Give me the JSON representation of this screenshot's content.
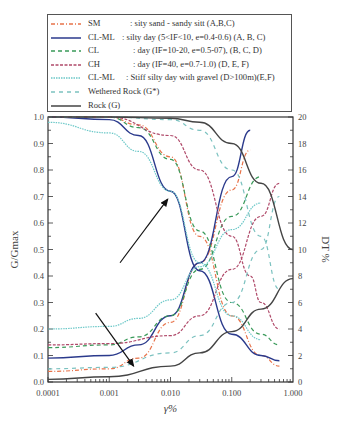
{
  "legend": {
    "items": [
      {
        "code": "SM",
        "desc": ": sity sand - sandy sitt (A,B,C)",
        "color": "#e8734a",
        "dash": "4,2,1,2",
        "desc_x": 82
      },
      {
        "code": "CL-ML",
        "desc": ": silty day (5<IF<10, e=0.4-0.6) (A, B, C)",
        "color": "#2b3a8c",
        "dash": "",
        "desc_x": 74
      },
      {
        "code": "CL",
        "desc": ": day (IF=10-20, e=0.5-07), (B, C, D)",
        "color": "#3a9a5a",
        "dash": "4,3",
        "desc_x": 85
      },
      {
        "code": "CH",
        "desc": ": day (IF=40, e=0.7-1.0) (D, E, F)",
        "color": "#b04a6a",
        "dash": "3,1.5",
        "desc_x": 85
      },
      {
        "code": "CL-ML",
        "desc": ": Stiff silty day with gravel (D>100m)(E,F)",
        "color": "#6cc8c8",
        "dash": "1.5,1",
        "desc_x": 78
      },
      {
        "code": "Wethered Rock (G*)",
        "desc": "",
        "color": "#7cc2c0",
        "dash": "4,4",
        "desc_x": 0
      },
      {
        "code": "Rock (G)",
        "desc": "",
        "color": "#444444",
        "dash": "",
        "desc_x": 0
      }
    ]
  },
  "axes": {
    "x_label": "γ%",
    "left_label": "G/Gmax",
    "right_label": "DT %",
    "x_ticks": [
      "0.0001",
      "0.001",
      "0.010",
      "0.100",
      "1.000"
    ],
    "left_ticks": [
      "0.0",
      "0.1",
      "0.2",
      "0.3",
      "0.4",
      "0.5",
      "0.6",
      "0.7",
      "0.8",
      "0.9",
      "1.0"
    ],
    "right_ticks": [
      "0",
      "2",
      "4",
      "6",
      "8",
      "10",
      "12",
      "14",
      "16",
      "18",
      "20"
    ]
  },
  "chart_data": {
    "type": "line",
    "title": "",
    "xlabel": "γ%",
    "ylabel": "G/Gmax",
    "y2label": "DT %",
    "xscale": "log",
    "xlim": [
      0.0001,
      1.0
    ],
    "ylim": [
      0.0,
      1.0
    ],
    "y2lim": [
      0,
      20
    ],
    "grid": false,
    "legend_position": "top (above plot)",
    "annotations": [
      {
        "type": "arrow",
        "from": [
          0.0015,
          0.45
        ],
        "to": [
          0.009,
          0.69
        ],
        "meaning": "G/Gmax curves"
      },
      {
        "type": "arrow",
        "from": [
          0.0006,
          0.26
        ],
        "to": [
          0.0025,
          0.06
        ],
        "meaning": "damping curves"
      }
    ],
    "series": [
      {
        "name": "SM : sity sand - sandy sitt (A,B,C)",
        "axis": "left",
        "color": "#e8734a",
        "x": [
          0.0001,
          0.001,
          0.003,
          0.01,
          0.03,
          0.1,
          0.3,
          0.6
        ],
        "y": [
          1.0,
          1.0,
          0.97,
          0.85,
          0.55,
          0.25,
          0.1,
          0.06
        ]
      },
      {
        "name": "SM damping",
        "axis": "right",
        "color": "#e8734a",
        "x": [
          0.0001,
          0.001,
          0.003,
          0.01,
          0.03,
          0.1,
          0.2
        ],
        "y": [
          0.8,
          1.0,
          1.8,
          4.5,
          9.0,
          14.5,
          17.5
        ]
      },
      {
        "name": "CL-ML : silty day (5<IF<10, e=0.4-0.6) (A, B, C)",
        "axis": "left",
        "color": "#2b3a8c",
        "x": [
          0.0001,
          0.001,
          0.003,
          0.01,
          0.03,
          0.1,
          0.3,
          0.6
        ],
        "y": [
          1.0,
          0.99,
          0.93,
          0.72,
          0.42,
          0.18,
          0.1,
          0.08
        ]
      },
      {
        "name": "CL-ML damping",
        "axis": "right",
        "color": "#2b3a8c",
        "x": [
          0.0001,
          0.001,
          0.003,
          0.01,
          0.03,
          0.1,
          0.2
        ],
        "y": [
          1.8,
          2.0,
          2.8,
          5.0,
          9.0,
          15.5,
          19.0
        ]
      },
      {
        "name": "CL : day (IF=10-20, e=0.5-07), (B, C, D)",
        "axis": "left",
        "color": "#3a9a5a",
        "x": [
          0.0001,
          0.001,
          0.003,
          0.01,
          0.03,
          0.1,
          0.3,
          0.6
        ],
        "y": [
          1.0,
          1.0,
          0.96,
          0.84,
          0.57,
          0.3,
          0.18,
          0.14
        ]
      },
      {
        "name": "CL damping",
        "axis": "right",
        "color": "#3a9a5a",
        "x": [
          0.0001,
          0.001,
          0.003,
          0.01,
          0.03,
          0.1,
          0.3
        ],
        "y": [
          2.6,
          2.8,
          3.4,
          5.0,
          8.5,
          12.5,
          15.5
        ]
      },
      {
        "name": "CH : day (IF=40, e=0.7-1.0) (D, E, F)",
        "axis": "left",
        "color": "#b04a6a",
        "x": [
          0.0001,
          0.001,
          0.01,
          0.03,
          0.1,
          0.2,
          0.3,
          0.6
        ],
        "y": [
          1.0,
          1.0,
          0.93,
          0.8,
          0.55,
          0.4,
          0.3,
          0.2
        ]
      },
      {
        "name": "CH damping",
        "axis": "right",
        "color": "#b04a6a",
        "x": [
          0.0001,
          0.001,
          0.01,
          0.03,
          0.1,
          0.3,
          0.6
        ],
        "y": [
          2.8,
          2.9,
          3.5,
          5.0,
          8.5,
          12.5,
          15.0
        ]
      },
      {
        "name": "CL-ML : Stiff silty day with gravel (D>100m)(E,F)",
        "axis": "left",
        "color": "#6cc8c8",
        "x": [
          0.0001,
          0.001,
          0.003,
          0.01,
          0.03,
          0.1,
          0.3
        ],
        "y": [
          0.98,
          0.94,
          0.87,
          0.72,
          0.45,
          0.25,
          0.16
        ]
      },
      {
        "name": "CL-ML (gravel) damping",
        "axis": "right",
        "color": "#6cc8c8",
        "x": [
          0.0001,
          0.001,
          0.003,
          0.01,
          0.03,
          0.1,
          0.3
        ],
        "y": [
          4.0,
          4.2,
          4.8,
          6.2,
          8.7,
          11.5,
          13.5
        ]
      },
      {
        "name": "Wethered Rock (G*)",
        "axis": "left",
        "color": "#7cc2c0",
        "x": [
          0.0001,
          0.001,
          0.01,
          0.03,
          0.1,
          0.3,
          0.6
        ],
        "y": [
          1.0,
          1.0,
          0.99,
          0.95,
          0.8,
          0.55,
          0.35
        ]
      },
      {
        "name": "Wethered Rock damping",
        "axis": "right",
        "color": "#7cc2c0",
        "x": [
          0.0001,
          0.001,
          0.01,
          0.03,
          0.1,
          0.3,
          0.6
        ],
        "y": [
          1.0,
          1.1,
          2.2,
          3.5,
          6.0,
          10.0,
          14.0
        ]
      },
      {
        "name": "Rock (G)",
        "axis": "left",
        "color": "#444444",
        "x": [
          0.0001,
          0.001,
          0.01,
          0.03,
          0.1,
          0.3,
          1.0
        ],
        "y": [
          1.0,
          1.0,
          0.995,
          0.98,
          0.9,
          0.75,
          0.5
        ]
      },
      {
        "name": "Rock damping",
        "axis": "right",
        "color": "#444444",
        "x": [
          0.0001,
          0.001,
          0.01,
          0.03,
          0.1,
          0.3,
          1.0
        ],
        "y": [
          0.2,
          0.4,
          1.2,
          2.2,
          3.8,
          5.5,
          7.8
        ]
      }
    ]
  }
}
